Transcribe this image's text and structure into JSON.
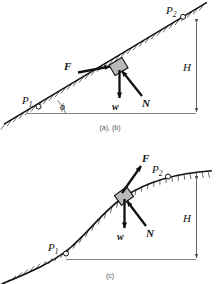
{
  "figure": {
    "type": "physics-free-body-diagram",
    "background": "#ffffff",
    "ink": "#1a1a1a",
    "hatch_color": "#3a3a3a",
    "block_fill": "#b9b9b9",
    "dimension_color": "#555555"
  },
  "captions": {
    "top": "(a), (b)",
    "bottom": "(c)"
  },
  "panel_a": {
    "name": "inclined-plane-panel",
    "surface": "straight inclined plane rising left to right",
    "point_start_label": "P",
    "point_start_sub": "1",
    "point_end_label": "P",
    "point_end_sub": "2",
    "angle_label": "ϕ",
    "height_label": "H",
    "forces": [
      {
        "symbol": "F",
        "description": "applied force up the incline",
        "direction": "up-right along slope"
      },
      {
        "symbol": "w",
        "description": "weight",
        "direction": "straight down"
      },
      {
        "symbol": "N",
        "description": "normal force",
        "direction": "perpendicular to incline, up-left"
      }
    ]
  },
  "panel_c": {
    "name": "curved-surface-panel",
    "surface": "S-shaped curved ramp rising left to right",
    "point_start_label": "P",
    "point_start_sub": "1",
    "point_end_label": "P",
    "point_end_sub": "2",
    "height_label": "H",
    "forces": [
      {
        "symbol": "F",
        "description": "applied force tangent to curve",
        "direction": "up-right"
      },
      {
        "symbol": "w",
        "description": "weight",
        "direction": "straight down"
      },
      {
        "symbol": "N",
        "description": "normal force",
        "direction": "perpendicular to curve, up-left"
      }
    ]
  }
}
